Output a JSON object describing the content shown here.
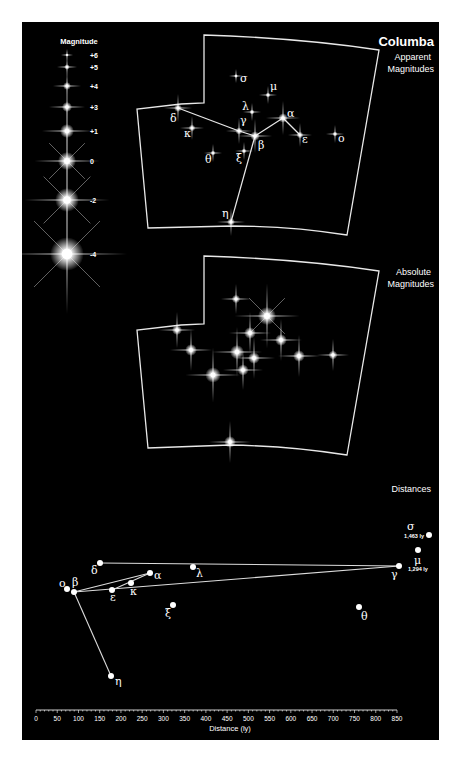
{
  "title": "Columba",
  "panels": {
    "apparent": {
      "label_line1": "Apparent",
      "label_line2": "Magnitudes"
    },
    "absolute": {
      "label_line1": "Absolute",
      "label_line2": "Magnitudes"
    },
    "distances": {
      "label": "Distances"
    }
  },
  "legend": {
    "title": "Magnitude",
    "entries": [
      {
        "label": "+6",
        "size": 1.2,
        "y": 55
      },
      {
        "label": "+5",
        "size": 2.0,
        "y": 67
      },
      {
        "label": "+4",
        "size": 2.8,
        "y": 86
      },
      {
        "label": "+3",
        "size": 3.6,
        "y": 107
      },
      {
        "label": "+1",
        "size": 5.0,
        "y": 131
      },
      {
        "label": "0",
        "size": 6.5,
        "y": 161
      },
      {
        "label": "-2",
        "size": 8.5,
        "y": 200
      },
      {
        "label": "-4",
        "size": 12,
        "y": 254
      }
    ]
  },
  "chart_data": {
    "type": "scatter",
    "title": "Columba",
    "xlabel": "Distance (ly)",
    "ylabel": "",
    "xlim": [
      0,
      850
    ],
    "x_ticks": [
      "0",
      "50",
      "100",
      "150",
      "200",
      "250",
      "300",
      "350",
      "400",
      "450",
      "500",
      "550",
      "600",
      "650",
      "700",
      "750",
      "800",
      "850"
    ],
    "grid": false,
    "stars": [
      {
        "name": "α",
        "distance_ly": 268
      },
      {
        "name": "β",
        "distance_ly": 87
      },
      {
        "name": "γ",
        "distance_ly": 850
      },
      {
        "name": "δ",
        "distance_ly": 158
      },
      {
        "name": "ε",
        "distance_ly": 262
      },
      {
        "name": "η",
        "distance_ly": 162
      },
      {
        "name": "θ",
        "distance_ly": 762
      },
      {
        "name": "κ",
        "distance_ly": 183
      },
      {
        "name": "λ",
        "distance_ly": 371
      },
      {
        "name": "μ",
        "distance_ly": 1294,
        "annotation": "1,294 ly"
      },
      {
        "name": "ξ",
        "distance_ly": 336
      },
      {
        "name": "ο",
        "distance_ly": 75
      },
      {
        "name": "σ",
        "distance_ly": 1463,
        "annotation": "1,463 ly"
      }
    ],
    "annotations": [
      "1,463 ly",
      "1,294 ly"
    ]
  },
  "apparent_stars": [
    {
      "name": "σ",
      "x": 236,
      "y": 76,
      "r": 1.4,
      "lx": 240,
      "ly": 82
    },
    {
      "name": "μ",
      "x": 268,
      "y": 95,
      "r": 1.8,
      "lx": 270,
      "ly": 90
    },
    {
      "name": "λ",
      "x": 252,
      "y": 112,
      "r": 1.8,
      "lx": 242,
      "ly": 110
    },
    {
      "name": "α",
      "x": 283,
      "y": 118,
      "r": 3.4,
      "lx": 287,
      "ly": 117
    },
    {
      "name": "δ",
      "x": 178,
      "y": 108,
      "r": 2.8,
      "lx": 170,
      "ly": 122
    },
    {
      "name": "κ",
      "x": 192,
      "y": 128,
      "r": 2.4,
      "lx": 184,
      "ly": 137
    },
    {
      "name": "γ",
      "x": 239,
      "y": 131,
      "r": 2.6,
      "lx": 240,
      "ly": 124
    },
    {
      "name": "β",
      "x": 255,
      "y": 136,
      "r": 3.4,
      "lx": 258,
      "ly": 149
    },
    {
      "name": "ε",
      "x": 300,
      "y": 135,
      "r": 2.4,
      "lx": 302,
      "ly": 143
    },
    {
      "name": "ο",
      "x": 335,
      "y": 134,
      "r": 1.8,
      "lx": 338,
      "ly": 142
    },
    {
      "name": "θ",
      "x": 213,
      "y": 153,
      "r": 1.8,
      "lx": 205,
      "ly": 163
    },
    {
      "name": "ξ",
      "x": 244,
      "y": 151,
      "r": 1.8,
      "lx": 236,
      "ly": 162
    },
    {
      "name": "η",
      "x": 231,
      "y": 222,
      "r": 2.8,
      "lx": 222,
      "ly": 217
    }
  ],
  "absolute_stars": [
    {
      "name": "σ",
      "x": 236,
      "y": 299,
      "r": 3.0
    },
    {
      "name": "μ",
      "x": 267,
      "y": 316,
      "r": 6.5
    },
    {
      "name": "λ",
      "x": 250,
      "y": 333,
      "r": 4.2
    },
    {
      "name": "α",
      "x": 281,
      "y": 340,
      "r": 4.2
    },
    {
      "name": "δ",
      "x": 177,
      "y": 330,
      "r": 3.6
    },
    {
      "name": "κ",
      "x": 191,
      "y": 350,
      "r": 4.2
    },
    {
      "name": "γ",
      "x": 237,
      "y": 352,
      "r": 5.0
    },
    {
      "name": "β",
      "x": 254,
      "y": 358,
      "r": 4.2
    },
    {
      "name": "ε",
      "x": 299,
      "y": 356,
      "r": 4.2
    },
    {
      "name": "ο",
      "x": 333,
      "y": 355,
      "r": 3.2
    },
    {
      "name": "θ",
      "x": 213,
      "y": 375,
      "r": 5.5
    },
    {
      "name": "ξ",
      "x": 243,
      "y": 370,
      "r": 4.0
    },
    {
      "name": "η",
      "x": 230,
      "y": 442,
      "r": 4.2
    }
  ],
  "distance_points": [
    {
      "name": "δ",
      "x": 100,
      "y": 563,
      "lx": 91,
      "ly": 574
    },
    {
      "name": "λ",
      "x": 193,
      "y": 567,
      "lx": 196,
      "ly": 577
    },
    {
      "name": "α",
      "x": 150,
      "y": 573,
      "lx": 154,
      "ly": 579
    },
    {
      "name": "κ",
      "x": 131,
      "y": 583,
      "lx": 130,
      "ly": 595
    },
    {
      "name": "ε",
      "x": 112,
      "y": 590,
      "lx": 110,
      "ly": 601
    },
    {
      "name": "β",
      "x": 74,
      "y": 592,
      "lx": 72,
      "ly": 586
    },
    {
      "name": "ο",
      "x": 67,
      "y": 589,
      "lx": 59,
      "ly": 587
    },
    {
      "name": "ξ",
      "x": 173,
      "y": 605,
      "lx": 165,
      "ly": 617
    },
    {
      "name": "η",
      "x": 111,
      "y": 676,
      "lx": 115,
      "ly": 685
    },
    {
      "name": "γ",
      "x": 399,
      "y": 566,
      "lx": 391,
      "ly": 578
    },
    {
      "name": "μ",
      "x": 418,
      "y": 550,
      "lx": 414,
      "ly": 564
    },
    {
      "name": "σ",
      "x": 429,
      "y": 535,
      "lx": 407,
      "ly": 530
    },
    {
      "name": "θ",
      "x": 359,
      "y": 607,
      "lx": 361,
      "ly": 620
    }
  ]
}
